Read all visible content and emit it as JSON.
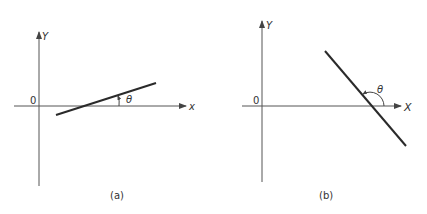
{
  "panels": [
    {
      "id": "a",
      "caption": "(a)",
      "origin_label": "0",
      "x_axis_label": "x",
      "y_axis_label": "Y",
      "angle_label": "θ",
      "description": "Line with positive slope; angle θ measured counterclockwise from the x-axis (acute)"
    },
    {
      "id": "b",
      "caption": "(b)",
      "origin_label": "0",
      "x_axis_label": "X",
      "y_axis_label": "Y",
      "angle_label": "θ",
      "description": "Line with negative slope; angle θ measured counterclockwise from the x-axis (obtuse)"
    }
  ],
  "colors": {
    "stroke": "#2a2a2a",
    "axis": "#555555",
    "background": "#ffffff"
  }
}
